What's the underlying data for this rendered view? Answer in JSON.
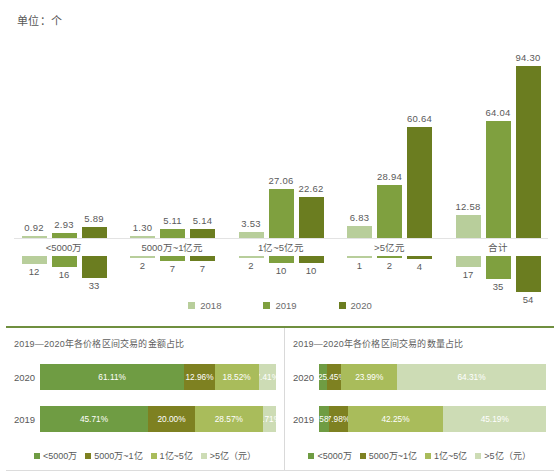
{
  "unit_label": "单位：个",
  "colors": {
    "y2018": "#b8ce9b",
    "y2019": "#7fa03f",
    "y2020": "#6b7d20",
    "seg1": "#6f9c43",
    "seg2": "#7e8121",
    "seg3": "#a9bc5b",
    "seg4": "#cddcb5",
    "accent": "#6f8f3f"
  },
  "legend": {
    "years": [
      {
        "label": "2018",
        "color": "#b8ce9b"
      },
      {
        "label": "2019",
        "color": "#7fa03f"
      },
      {
        "label": "2020",
        "color": "#6b7d20"
      }
    ],
    "ranges": [
      {
        "label": "<5000万",
        "color": "#6f9c43"
      },
      {
        "label": "5000万~1亿",
        "color": "#7e8121"
      },
      {
        "label": "1亿~5亿",
        "color": "#a9bc5b"
      },
      {
        "label": ">5亿（元）",
        "color": "#cddcb5"
      }
    ]
  },
  "chart_data": [
    {
      "type": "bar",
      "title": "",
      "xlabel": "",
      "ylabel": "单位：个",
      "categories": [
        "<5000万",
        "5000万~1亿元",
        "1亿~5亿元",
        ">5亿元",
        "合计"
      ],
      "series": [
        {
          "name": "2018",
          "values": [
            0.92,
            1.3,
            3.53,
            6.83,
            12.58
          ]
        },
        {
          "name": "2019",
          "values": [
            2.93,
            5.11,
            27.06,
            28.94,
            64.04
          ]
        },
        {
          "name": "2020",
          "values": [
            5.89,
            5.14,
            22.62,
            60.64,
            94.3
          ]
        }
      ],
      "ylim": [
        0,
        94.3
      ],
      "grid": false,
      "legend_position": "bottom"
    },
    {
      "type": "bar",
      "title": "",
      "orientation": "inverted",
      "categories": [
        "<5000万",
        "5000万~1亿元",
        "1亿~5亿元",
        ">5亿元",
        "合计"
      ],
      "series": [
        {
          "name": "2018",
          "values": [
            12,
            2,
            2,
            1,
            17
          ]
        },
        {
          "name": "2019",
          "values": [
            16,
            7,
            10,
            2,
            35
          ]
        },
        {
          "name": "2020",
          "values": [
            33,
            7,
            10,
            4,
            54
          ]
        }
      ],
      "ylim": [
        0,
        54
      ],
      "grid": false,
      "legend_position": "bottom"
    },
    {
      "type": "bar",
      "subtype": "stacked-100",
      "title": "2019—2020年各价格区间交易的金额占比",
      "categories": [
        "<5000万",
        "5000万~1亿",
        "1亿~5亿",
        ">5亿（元）"
      ],
      "rows": [
        {
          "name": "2020",
          "values": [
            61.11,
            12.96,
            18.52,
            7.41
          ]
        },
        {
          "name": "2019",
          "values": [
            45.71,
            20.0,
            28.57,
            5.71
          ]
        }
      ],
      "unit": "%",
      "legend_position": "bottom"
    },
    {
      "type": "bar",
      "subtype": "stacked-100",
      "title": "2019—2020年各价格区间交易的数量占比",
      "categories": [
        "<5000万",
        "5000万~1亿",
        "1亿~5亿",
        ">5亿（元）"
      ],
      "rows": [
        {
          "name": "2020",
          "values": [
            3.25,
            6.45,
            23.99,
            64.31
          ]
        },
        {
          "name": "2019",
          "values": [
            4.58,
            7.98,
            42.25,
            45.19
          ]
        }
      ],
      "unit": "%",
      "legend_position": "bottom"
    }
  ],
  "top_chart": {
    "groups": [
      {
        "category": "<5000万",
        "up": [
          {
            "year": "2018",
            "value": "0.92"
          },
          {
            "year": "2019",
            "value": "2.93"
          },
          {
            "year": "2020",
            "value": "5.89"
          }
        ],
        "down": [
          {
            "year": "2018",
            "value": "12"
          },
          {
            "year": "2019",
            "value": "16"
          },
          {
            "year": "2020",
            "value": "33"
          }
        ]
      },
      {
        "category": "5000万~1亿元",
        "up": [
          {
            "year": "2018",
            "value": "1.30"
          },
          {
            "year": "2019",
            "value": "5.11"
          },
          {
            "year": "2020",
            "value": "5.14"
          }
        ],
        "down": [
          {
            "year": "2018",
            "value": "2"
          },
          {
            "year": "2019",
            "value": "7"
          },
          {
            "year": "2020",
            "value": "7"
          }
        ]
      },
      {
        "category": "1亿~5亿元",
        "up": [
          {
            "year": "2018",
            "value": "3.53"
          },
          {
            "year": "2019",
            "value": "27.06"
          },
          {
            "year": "2020",
            "value": "22.62"
          }
        ],
        "down": [
          {
            "year": "2018",
            "value": "2"
          },
          {
            "year": "2019",
            "value": "10"
          },
          {
            "year": "2020",
            "value": "10"
          }
        ]
      },
      {
        "category": ">5亿元",
        "up": [
          {
            "year": "2018",
            "value": "6.83"
          },
          {
            "year": "2019",
            "value": "28.94"
          },
          {
            "year": "2020",
            "value": "60.64"
          }
        ],
        "down": [
          {
            "year": "2018",
            "value": "1"
          },
          {
            "year": "2019",
            "value": "2"
          },
          {
            "year": "2020",
            "value": "4"
          }
        ]
      },
      {
        "category": "合计",
        "up": [
          {
            "year": "2018",
            "value": "12.58"
          },
          {
            "year": "2019",
            "value": "64.04"
          },
          {
            "year": "2020",
            "value": "94.30"
          }
        ],
        "down": [
          {
            "year": "2018",
            "value": "17"
          },
          {
            "year": "2019",
            "value": "35"
          },
          {
            "year": "2020",
            "value": "54"
          }
        ]
      }
    ]
  },
  "panels": [
    {
      "title": "2019—2020年各价格区间交易的金额占比",
      "rows": [
        {
          "label": "2020",
          "segments": [
            "61.11%",
            "12.96%",
            "18.52%",
            "7.41%"
          ]
        },
        {
          "label": "2019",
          "segments": [
            "45.71%",
            "20.00%",
            "28.57%",
            "5.71%"
          ]
        }
      ]
    },
    {
      "title": "2019—2020年各价格区间交易的数量占比",
      "rows": [
        {
          "label": "2020",
          "segments": [
            "3.25%",
            "6.45%",
            "23.99%",
            "64.31%"
          ]
        },
        {
          "label": "2019",
          "segments": [
            "4.58%",
            "7.98%",
            "42.25%",
            "45.19%"
          ]
        }
      ]
    }
  ]
}
